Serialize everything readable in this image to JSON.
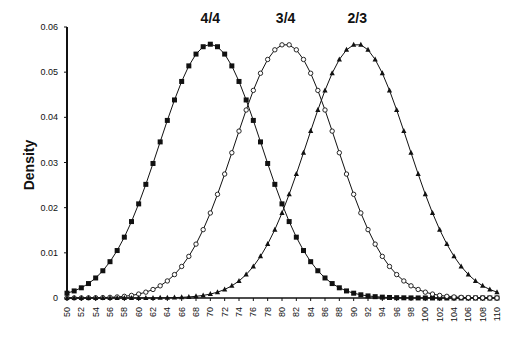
{
  "chart_data": {
    "type": "line",
    "title": "",
    "xlabel": "",
    "ylabel": "Density",
    "xlim": [
      50,
      110
    ],
    "ylim": [
      0,
      0.06
    ],
    "grid": false,
    "legend_position": "inline labels above peaks",
    "x_ticks": [
      50,
      52,
      54,
      56,
      58,
      60,
      62,
      64,
      66,
      68,
      70,
      72,
      74,
      76,
      78,
      80,
      82,
      84,
      86,
      88,
      90,
      92,
      94,
      96,
      98,
      100,
      102,
      104,
      106,
      108,
      110
    ],
    "y_ticks": [
      0,
      0.01,
      0.02,
      0.03,
      0.04,
      0.05,
      0.06
    ],
    "y_tick_labels": [
      "0",
      "0.01",
      "0.02",
      "0.03",
      "0.04",
      "0.05",
      "0.06"
    ],
    "x_step": 1,
    "series": [
      {
        "name": "4/4",
        "marker": "filled-square",
        "distribution": "normal",
        "mean": 70,
        "sd": 7.1,
        "peak": 0.056
      },
      {
        "name": "3/4",
        "marker": "open-circle",
        "distribution": "normal",
        "mean": 80.5,
        "sd": 7.1,
        "peak": 0.056
      },
      {
        "name": "2/3",
        "marker": "filled-triangle",
        "distribution": "normal",
        "mean": 90.5,
        "sd": 7.1,
        "peak": 0.056
      }
    ],
    "annotations": [
      {
        "text": "4/4",
        "x": 70,
        "y": 0.06
      },
      {
        "text": "3/4",
        "x": 80.5,
        "y": 0.06
      },
      {
        "text": "2/3",
        "x": 90.5,
        "y": 0.06
      }
    ]
  }
}
